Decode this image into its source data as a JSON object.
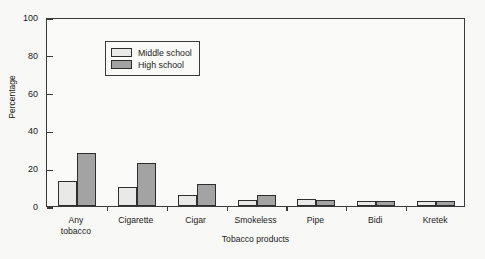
{
  "chart_data": {
    "type": "bar",
    "title": "",
    "xlabel": "Tobacco products",
    "ylabel": "Percentage",
    "categories": [
      "Any tobacco",
      "Cigarette",
      "Cigar",
      "Smokeless",
      "Pipe",
      "Bidi",
      "Kretek"
    ],
    "category_lines": [
      [
        "Any",
        "tobacco"
      ],
      [
        "Cigarette"
      ],
      [
        "Cigar"
      ],
      [
        "Smokeless"
      ],
      [
        "Pipe"
      ],
      [
        "Bidi"
      ],
      [
        "Kretek"
      ]
    ],
    "series": [
      {
        "name": "Middle school",
        "color": "#e9e9e7",
        "values": [
          13,
          10,
          6,
          3,
          3.5,
          2.5,
          2.5
        ]
      },
      {
        "name": "High school",
        "color": "#a3a3a3",
        "values": [
          28,
          22.5,
          11.5,
          6,
          3,
          2.5,
          2.5
        ]
      }
    ],
    "ylim": [
      0,
      100
    ],
    "yticks": [
      0,
      20,
      40,
      60,
      80,
      100
    ],
    "ytick_labels": [
      "0",
      "20",
      "40",
      "60",
      "80",
      "100"
    ],
    "grid": false,
    "legend_position": "upper-left",
    "legend_entries": [
      "Middle school",
      "High school"
    ]
  },
  "colors": {
    "background": "#f8f8f6",
    "plot_background": "#fafaf8",
    "axis": "#3a3a3a",
    "text": "#1a1a1a",
    "middle_school": "#e9e9e7",
    "high_school": "#a3a3a3"
  }
}
